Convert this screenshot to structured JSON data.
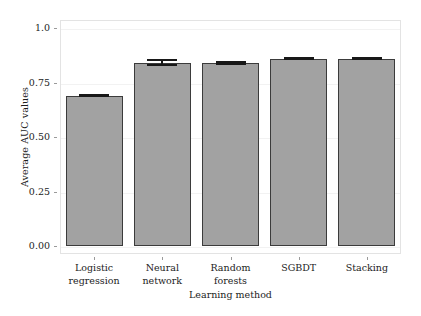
{
  "chart_data": {
    "type": "bar",
    "title": "",
    "xlabel": "Learning method",
    "ylabel": "Average AUC values",
    "categories": [
      "Logistic regression",
      "Neural network",
      "Random forests",
      "SGBDT",
      "Stacking"
    ],
    "category_lines": [
      [
        "Logistic",
        "regression"
      ],
      [
        "Neural",
        "network"
      ],
      [
        "Random",
        "forests"
      ],
      [
        "SGBDT"
      ],
      [
        "Stacking"
      ]
    ],
    "values": [
      0.69,
      0.84,
      0.84,
      0.86,
      0.86
    ],
    "errors": [
      0.004,
      0.012,
      0.004,
      0.004,
      0.004
    ],
    "ylim": [
      0.0,
      1.05
    ],
    "yticks": [
      0.0,
      0.25,
      0.5,
      0.75,
      1.0
    ],
    "ytick_labels": [
      "0.00",
      "0.25",
      "0.50",
      "0.75",
      "1.0"
    ],
    "grid": true,
    "legend": "none",
    "bar_color": "#a2a2a2",
    "bar_edge_color": "#3b3b3b",
    "error_color": "#181818",
    "grid_color": "#f2f2f2",
    "frame_color": "#e3e3e3",
    "text_color": "#1c1c1c"
  }
}
